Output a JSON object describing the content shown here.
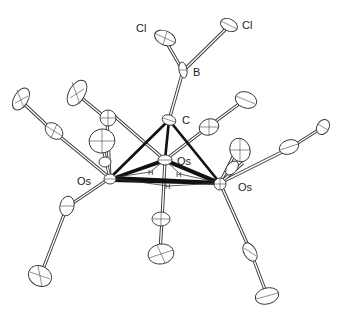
{
  "diagram": {
    "type": "ORTEP molecular structure",
    "labels": {
      "cl_left": "Cl",
      "cl_right": "Cl",
      "boron": "B",
      "carbon": "C",
      "os_top": "Os",
      "os_left": "Os",
      "os_right": "Os",
      "h1": "H",
      "h2": "H",
      "h3": "H"
    },
    "atoms": [
      {
        "id": "Cl1",
        "label": "Cl",
        "x": 165,
        "y": 40
      },
      {
        "id": "Cl2",
        "label": "Cl",
        "x": 230,
        "y": 25
      },
      {
        "id": "B",
        "label": "B",
        "x": 183,
        "y": 71
      },
      {
        "id": "C",
        "label": "C",
        "x": 169,
        "y": 120
      },
      {
        "id": "Os_top",
        "label": "Os",
        "x": 165,
        "y": 160
      },
      {
        "id": "Os_left",
        "label": "Os",
        "x": 110,
        "y": 178
      },
      {
        "id": "Os_right",
        "label": "Os",
        "x": 220,
        "y": 183
      }
    ],
    "bonds": [
      [
        "Cl1",
        "B"
      ],
      [
        "Cl2",
        "B"
      ],
      [
        "B",
        "C"
      ],
      [
        "C",
        "Os_top"
      ],
      [
        "C",
        "Os_left"
      ],
      [
        "C",
        "Os_right"
      ],
      [
        "Os_top",
        "Os_left"
      ],
      [
        "Os_top",
        "Os_right"
      ],
      [
        "Os_left",
        "Os_right"
      ]
    ],
    "bridging_hydrides": 3,
    "carbonyl_ligands": 9
  }
}
